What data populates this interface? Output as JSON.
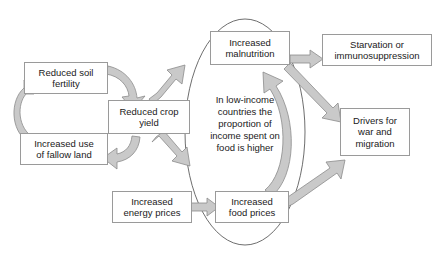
{
  "diagram": {
    "background_color": "#ffffff",
    "box_fill": "#ffffff",
    "box_border_color": "#9a9a9a",
    "arrow_fill": "#c9c9c9",
    "arrow_border_color": "#8c8c8c",
    "ellipse_border_color": "#6e6e6e",
    "nodes": [
      {
        "id": "reduced-soil-fertility",
        "label": "Reduced soil\nfertility",
        "line1": "Reduced soil",
        "line2": "fertility"
      },
      {
        "id": "increased-use-fallow-land",
        "label": "Increased use\nof fallow land",
        "line1": "Increased use",
        "line2": "of fallow land"
      },
      {
        "id": "reduced-crop-yield",
        "label": "Reduced crop\nyield",
        "line1": "Reduced crop",
        "line2": "yield"
      },
      {
        "id": "increased-energy-prices",
        "label": "Increased\nenergy prices",
        "line1": "Increased",
        "line2": "energy prices"
      },
      {
        "id": "increased-food-prices",
        "label": "Increased\nfood prices",
        "line1": "Increased",
        "line2": "food prices"
      },
      {
        "id": "increased-malnutrition",
        "label": "Increased\nmalnutrition",
        "line1": "Increased",
        "line2": "malnutrition"
      },
      {
        "id": "starvation-or-immunosuppression",
        "label": "Starvation or\nimmunosuppression",
        "line1": "Starvation or",
        "line2": "immunosuppression"
      },
      {
        "id": "drivers-for-war-and-migration",
        "label": "Drivers for\nwar and\nmigration",
        "line1": "Drivers for",
        "line2": "war and",
        "line3": "migration"
      }
    ],
    "ellipse_note": {
      "id": "low-income-note",
      "line1": "In low-income",
      "line2": "countries the",
      "line3": "proportion of",
      "line4": "income spent on",
      "line5": "food is higher"
    },
    "connections": [
      {
        "from": "increased-use-fallow-land",
        "to": "reduced-soil-fertility",
        "style": "curved"
      },
      {
        "from": "reduced-soil-fertility",
        "to": "reduced-crop-yield",
        "style": "curved"
      },
      {
        "from": "reduced-crop-yield",
        "to": "increased-use-fallow-land",
        "style": "curved"
      },
      {
        "from": "reduced-crop-yield",
        "to": "increased-malnutrition",
        "style": "straight"
      },
      {
        "from": "reduced-crop-yield",
        "to": "increased-food-prices",
        "style": "straight"
      },
      {
        "from": "increased-energy-prices",
        "to": "increased-food-prices",
        "style": "straight"
      },
      {
        "from": "increased-food-prices",
        "to": "increased-malnutrition",
        "style": "curved"
      },
      {
        "from": "increased-food-prices",
        "to": "drivers-for-war-and-migration",
        "style": "straight"
      },
      {
        "from": "increased-malnutrition",
        "to": "starvation-or-immunosuppression",
        "style": "straight"
      },
      {
        "from": "increased-malnutrition",
        "to": "drivers-for-war-and-migration",
        "style": "straight"
      }
    ]
  }
}
